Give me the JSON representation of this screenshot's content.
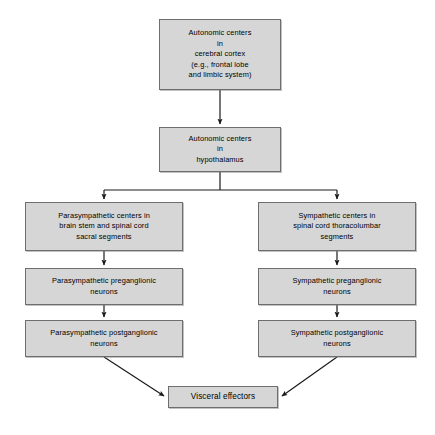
{
  "diagram": {
    "colors": {
      "node_fill": "#d6d6d6",
      "node_border": "#6e6e6e",
      "connector": "#1a1a1a",
      "background": "#ffffff"
    },
    "nodes": {
      "cortex": {
        "label": "Autonomic centers\nin\ncerebral cortex\n(e.g., frontal lobe\nand limbic system)"
      },
      "hypothalamus": {
        "label": "Autonomic centers\nin\nhypothalamus"
      },
      "parasympathetic_centers": {
        "label": "Parasympathetic centers in\nbrain stem and spinal cord\nsacral segments"
      },
      "sympathetic_centers": {
        "label": "Sympathetic centers in\nspinal cord thoracolumbar\nsegments"
      },
      "parasympathetic_preganglionic": {
        "label": "Parasympathetic preganglionic\nneurons"
      },
      "sympathetic_preganglionic": {
        "label": "Sympathetic preganglionic\nneurons"
      },
      "parasympathetic_postganglionic": {
        "label": "Parasympathetic postganglionic\nneurons"
      },
      "sympathetic_postganglionic": {
        "label": "Sympathetic postganglionic\nneurons"
      },
      "visceral_effectors": {
        "label": "Visceral effectors"
      }
    },
    "edges": [
      {
        "from": "cortex",
        "to": "hypothalamus",
        "style": "straight-vertical-arrow"
      },
      {
        "from": "hypothalamus",
        "to": "parasympathetic_centers",
        "style": "split-branch-arrow"
      },
      {
        "from": "hypothalamus",
        "to": "sympathetic_centers",
        "style": "split-branch-arrow"
      },
      {
        "from": "parasympathetic_centers",
        "to": "parasympathetic_preganglionic",
        "style": "straight-vertical-arrow"
      },
      {
        "from": "sympathetic_centers",
        "to": "sympathetic_preganglionic",
        "style": "straight-vertical-arrow"
      },
      {
        "from": "parasympathetic_preganglionic",
        "to": "parasympathetic_postganglionic",
        "style": "straight-vertical-arrow"
      },
      {
        "from": "sympathetic_preganglionic",
        "to": "sympathetic_postganglionic",
        "style": "straight-vertical-arrow"
      },
      {
        "from": "parasympathetic_postganglionic",
        "to": "visceral_effectors",
        "style": "diagonal-arrow"
      },
      {
        "from": "sympathetic_postganglionic",
        "to": "visceral_effectors",
        "style": "diagonal-arrow"
      }
    ]
  }
}
